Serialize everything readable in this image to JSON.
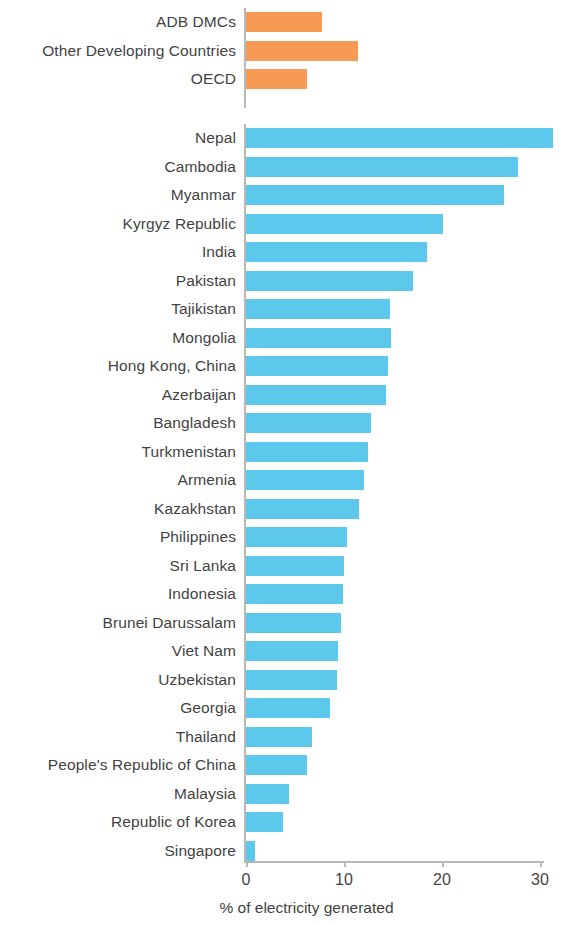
{
  "chart_data": {
    "type": "bar",
    "orientation": "horizontal",
    "title": "",
    "xlabel": "% of electricity generated",
    "ylabel": "",
    "xlim": [
      0,
      31.8
    ],
    "xticks": [
      0,
      10,
      20,
      30
    ],
    "xtick_labels": [
      "0",
      "10",
      "20",
      "30"
    ],
    "grid": false,
    "legend": "none",
    "colors": {
      "aggregate_group": "#F79A54",
      "economy": "#5BC8EC",
      "axis": "#b8b8b8",
      "text": "#434343",
      "background": "#ffffff"
    },
    "groups": [
      {
        "name": "aggregates",
        "color": "#F79A54",
        "categories": [
          "ADB DMCs",
          "Other Developing Countries",
          "OECD"
        ],
        "values": [
          7.8,
          11.4,
          6.2
        ]
      },
      {
        "name": "economies",
        "color": "#5BC8EC",
        "categories": [
          "Nepal",
          "Cambodia",
          "Myanmar",
          "Kyrgyz Republic",
          "India",
          "Pakistan",
          "Tajikistan",
          "Mongolia",
          "Hong Kong, China",
          "Azerbaijan",
          "Bangladesh",
          "Turkmenistan",
          "Armenia",
          "Kazakhstan",
          "Philippines",
          "Sri Lanka",
          "Indonesia",
          "Brunei Darussalam",
          "Viet Nam",
          "Uzbekistan",
          "Georgia",
          "Thailand",
          "People's Republic of China",
          "Malaysia",
          "Republic of Korea",
          "Singapore"
        ],
        "values": [
          31.3,
          27.8,
          26.3,
          20.1,
          18.5,
          17.0,
          14.7,
          14.8,
          14.5,
          14.3,
          12.8,
          12.4,
          12.0,
          11.5,
          10.3,
          10.0,
          9.9,
          9.7,
          9.4,
          9.3,
          8.6,
          6.7,
          6.2,
          4.4,
          3.8,
          0.9
        ]
      }
    ]
  }
}
